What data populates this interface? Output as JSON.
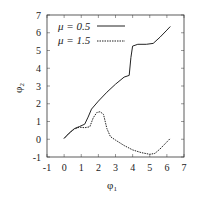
{
  "chart_data": {
    "type": "line",
    "title": "",
    "xlabel": "φ1",
    "ylabel": "φ2",
    "xlim": [
      -1,
      7
    ],
    "ylim": [
      -1,
      7
    ],
    "xticks": [
      "-1",
      "0",
      "1",
      "2",
      "3",
      "4",
      "5",
      "6",
      "7"
    ],
    "yticks": [
      "-1",
      "0",
      "1",
      "2",
      "3",
      "4",
      "5",
      "6",
      "7"
    ],
    "grid": false,
    "legend_position": "upper left",
    "series": [
      {
        "name": "μ = 0.5",
        "style": "solid",
        "x": [
          0.0,
          0.3,
          0.6,
          0.9,
          1.2,
          1.4,
          1.6,
          2.0,
          2.5,
          3.0,
          3.5,
          3.8,
          3.9,
          4.0,
          4.3,
          4.8,
          5.2,
          5.6,
          6.0,
          6.2
        ],
        "y": [
          0.05,
          0.35,
          0.6,
          0.72,
          0.85,
          1.25,
          1.7,
          2.15,
          2.65,
          3.1,
          3.5,
          3.6,
          4.6,
          5.25,
          5.35,
          5.35,
          5.4,
          5.75,
          6.15,
          6.35
        ]
      },
      {
        "name": "μ = 1.5",
        "style": "dashed",
        "x": [
          0.0,
          0.3,
          0.6,
          0.9,
          1.2,
          1.5,
          1.7,
          1.9,
          2.1,
          2.3,
          2.5,
          2.7,
          3.0,
          3.5,
          4.0,
          4.5,
          5.0,
          5.3,
          5.6,
          6.0,
          6.2
        ],
        "y": [
          0.05,
          0.35,
          0.58,
          0.68,
          0.65,
          0.7,
          1.2,
          1.5,
          1.55,
          1.4,
          0.6,
          0.15,
          -0.05,
          -0.35,
          -0.6,
          -0.75,
          -0.85,
          -0.8,
          -0.55,
          -0.15,
          0.05
        ]
      }
    ]
  },
  "legend": {
    "entries": [
      {
        "label": "μ = 0.5"
      },
      {
        "label": "μ = 1.5"
      }
    ]
  },
  "axes": {
    "xlabel_main": "φ",
    "xlabel_sub": "1",
    "ylabel_main": "φ",
    "ylabel_sub": "2"
  }
}
